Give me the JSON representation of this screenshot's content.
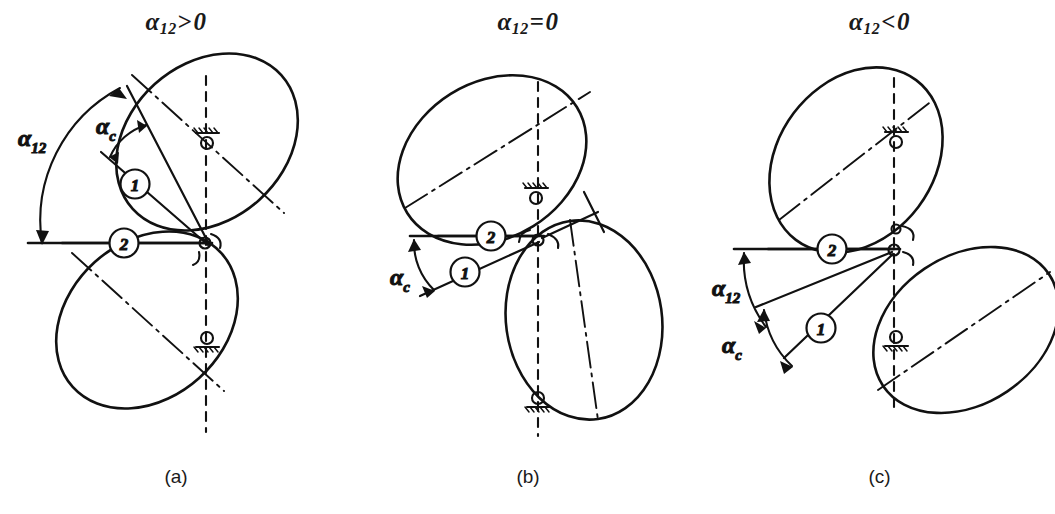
{
  "figure": {
    "type": "technical-diagram",
    "panels": [
      {
        "id": "a",
        "caption": "(a)",
        "title": {
          "symbol": "α",
          "subscript": "12",
          "relation": ">",
          "value": "0"
        },
        "title_text": "α₁₂ > 0",
        "angle_labels": [
          {
            "name": "alpha-12",
            "symbol": "α",
            "subscript": "12"
          },
          {
            "name": "alpha-c",
            "symbol": "α",
            "subscript": "c"
          }
        ],
        "link_callouts": [
          {
            "name": "link-1",
            "number": "1"
          },
          {
            "name": "link-2",
            "number": "2"
          }
        ]
      },
      {
        "id": "b",
        "caption": "(b)",
        "title": {
          "symbol": "α",
          "subscript": "12",
          "relation": "=",
          "value": "0"
        },
        "title_text": "α₁₂ = 0",
        "angle_labels": [
          {
            "name": "alpha-c",
            "symbol": "α",
            "subscript": "c"
          }
        ],
        "link_callouts": [
          {
            "name": "link-1",
            "number": "1"
          },
          {
            "name": "link-2",
            "number": "2"
          }
        ]
      },
      {
        "id": "c",
        "caption": "(c)",
        "title": {
          "symbol": "α",
          "subscript": "12",
          "relation": "<",
          "value": "0"
        },
        "title_text": "α₁₂ < 0",
        "angle_labels": [
          {
            "name": "alpha-12",
            "symbol": "α",
            "subscript": "12"
          },
          {
            "name": "alpha-c",
            "symbol": "α",
            "subscript": "c"
          }
        ],
        "link_callouts": [
          {
            "name": "link-1",
            "number": "1"
          },
          {
            "name": "link-2",
            "number": "2"
          }
        ]
      }
    ],
    "symbols": {
      "alpha": "α",
      "sub_12": "12",
      "sub_c": "c",
      "gt": ">",
      "eq": "=",
      "lt": "<",
      "zero": "0",
      "one": "1",
      "two": "2"
    },
    "colors": {
      "ink": "#111111",
      "background": "#ffffff"
    }
  }
}
